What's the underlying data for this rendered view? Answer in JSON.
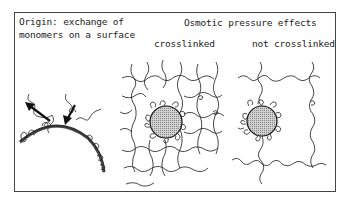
{
  "diagram": {
    "left_panel": {
      "title_line1": "Origin: exchange of",
      "title_line2": "monomers on a surface",
      "elements": [
        "curved-surface",
        "outgoing-arrow",
        "incoming-arrow",
        "adsorbed-chains"
      ]
    },
    "right_panel": {
      "title": "Osmotic pressure effects",
      "sub_left": "crosslinked",
      "sub_right": "not crosslinked",
      "elements": [
        "crosslinked-network",
        "particle-crosslinked",
        "particle-not-crosslinked",
        "free-chains"
      ]
    },
    "colors": {
      "line": "#1a1a1a",
      "particle_fill": "#b8b8b8",
      "surface": "#3a3a3a",
      "frame": "#444444"
    }
  }
}
